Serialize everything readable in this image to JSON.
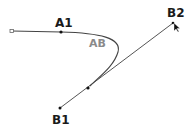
{
  "diagram": {
    "labels": {
      "a1": "A1",
      "ab": "AB",
      "b1": "B1",
      "b2": "B2"
    },
    "colors": {
      "line": "#444444",
      "curve": "#555555",
      "point": "#111111",
      "label": "#1a1a1a",
      "label_secondary": "#8a8a8a",
      "background": "#ffffff"
    },
    "points": {
      "start": {
        "x": 12,
        "y": 31
      },
      "a1": {
        "x": 61,
        "y": 32
      },
      "mid": {
        "x": 88,
        "y": 88
      },
      "b1": {
        "x": 60,
        "y": 108
      },
      "b2": {
        "x": 173,
        "y": 23
      }
    }
  }
}
